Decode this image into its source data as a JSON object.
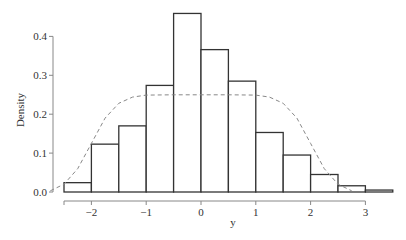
{
  "chart_data": {
    "type": "bar",
    "subtype": "histogram",
    "title": "",
    "xlabel": "y",
    "ylabel": "Density",
    "xlim": [
      -2.5,
      3.5
    ],
    "ylim": [
      0,
      0.4
    ],
    "x_axis_range": [
      -2.5,
      3
    ],
    "x_ticks": [
      -2,
      -1,
      0,
      1,
      2,
      3
    ],
    "x_tick_labels": [
      "−2",
      "−1",
      "0",
      "1",
      "2",
      "3"
    ],
    "y_ticks": [
      0.0,
      0.1,
      0.2,
      0.3,
      0.4
    ],
    "y_tick_labels": [
      "0.0",
      "0.1",
      "0.2",
      "0.3",
      "0.4"
    ],
    "grid": false,
    "legend": "none",
    "bins": [
      {
        "left": -2.5,
        "right": -2.0,
        "density": 0.024
      },
      {
        "left": -2.0,
        "right": -1.5,
        "density": 0.123
      },
      {
        "left": -1.5,
        "right": -1.0,
        "density": 0.17
      },
      {
        "left": -1.0,
        "right": -0.5,
        "density": 0.274
      },
      {
        "left": -0.5,
        "right": 0.0,
        "density": 0.459
      },
      {
        "left": 0.0,
        "right": 0.5,
        "density": 0.366
      },
      {
        "left": 0.5,
        "right": 1.0,
        "density": 0.285
      },
      {
        "left": 1.0,
        "right": 1.5,
        "density": 0.153
      },
      {
        "left": 1.5,
        "right": 2.0,
        "density": 0.095
      },
      {
        "left": 2.0,
        "right": 2.5,
        "density": 0.045
      },
      {
        "left": 2.5,
        "right": 3.0,
        "density": 0.016
      },
      {
        "left": 3.0,
        "right": 3.5,
        "density": 0.005
      }
    ],
    "overlay_curve": {
      "name": "density curve",
      "style": "dashed",
      "x": [
        -2.75,
        -2.5,
        -2.25,
        -2.0,
        -1.75,
        -1.5,
        -1.25,
        -1.0,
        -0.5,
        0.0,
        0.5,
        1.0,
        1.25,
        1.5,
        1.75,
        2.0,
        2.25,
        2.5,
        2.75
      ],
      "y": [
        0.003,
        0.02,
        0.06,
        0.125,
        0.19,
        0.228,
        0.244,
        0.249,
        0.25,
        0.25,
        0.25,
        0.249,
        0.244,
        0.228,
        0.19,
        0.125,
        0.06,
        0.02,
        0.003
      ]
    }
  },
  "colors": {
    "bar_fill": "#ffffff",
    "bar_stroke": "#333333",
    "axis": "#888888",
    "curve": "#888888"
  }
}
